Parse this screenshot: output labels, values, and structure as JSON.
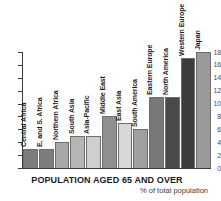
{
  "chart_data": {
    "type": "bar",
    "title": "POPULATION AGED 65 AND OVER",
    "subtitle": "% of total population",
    "xlabel": "",
    "ylabel": "",
    "ylim": [
      0,
      18
    ],
    "yticks": [
      0,
      2,
      4,
      6,
      8,
      10,
      12,
      14,
      16,
      18
    ],
    "grid": false,
    "legend": "none",
    "categories": [
      "Central Africa",
      "E. and S. Africa",
      "Northern Africa",
      "South Asia",
      "Asia-Pacific",
      "Middle East",
      "East Asia",
      "South America",
      "Eastern Europe",
      "North America",
      "Western Europe",
      "Japan"
    ],
    "values": [
      3,
      3,
      4,
      5,
      5,
      8,
      7,
      6,
      11,
      11,
      17,
      18
    ],
    "bar_colors": [
      "#7d7d7d",
      "#7d7d7d",
      "#a8a8a8",
      "#b5b5b5",
      "#cfcfcf",
      "#8f8f8f",
      "#d8d8d8",
      "#a0a0a0",
      "#787878",
      "#4a4a4a",
      "#3c3c3c",
      "#9a9a9a"
    ],
    "label_colors": [
      "#1c1c1c",
      "#1c1c1c",
      "#1c1c1c",
      "#1c1c1c",
      "#1c1c1c",
      "#1c1c1c",
      "#1c1c1c",
      "#1c1c1c",
      "#1c1c1c",
      "#1c1c1c",
      "#1c1c1c",
      "#1c1c1c"
    ],
    "axis_color": "#3b3b3b",
    "background": "#ffffff"
  }
}
